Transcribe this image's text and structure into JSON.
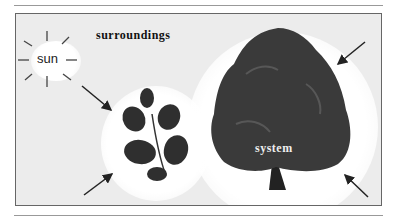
{
  "diagram": {
    "title": "surroundings",
    "sun_label": "sun",
    "system_label": "system",
    "colors": {
      "background": "#ececec",
      "glow": "#ffffff",
      "foliage": "#2a2a2a",
      "arrow": "#222222"
    }
  }
}
